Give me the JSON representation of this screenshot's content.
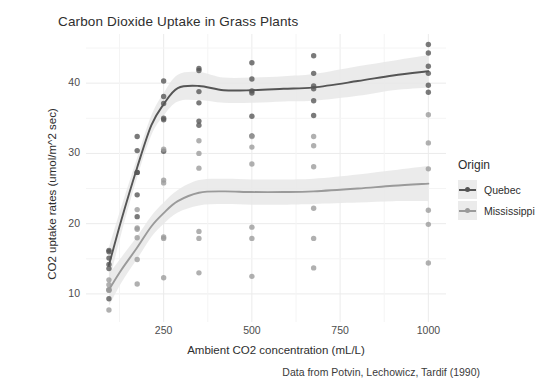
{
  "chart_data": {
    "type": "scatter",
    "title": "Carbon Dioxide Uptake in Grass Plants",
    "xlabel": "Ambient CO2 concentration (mL/L)",
    "ylabel": "CO2 uptake rates (umol/m^2 sec)",
    "caption": "Data from Potvin, Lechowicz, Tardif (1990)",
    "xlim": [
      30,
      1050
    ],
    "ylim": [
      6,
      47
    ],
    "xticks": [
      250,
      500,
      750,
      1000
    ],
    "yticks": [
      10,
      20,
      30,
      40
    ],
    "grid": true,
    "legend_position": "right",
    "legend_title": "Origin",
    "smoother": "loess with confidence ribbon",
    "colors": {
      "quebec": "#555555",
      "mississippi": "#9a9a9a",
      "ribbon": "#e8e8e8",
      "panel_background": "#ffffff",
      "gridline": "#ebebeb",
      "text": "#2e2e2e",
      "tick_text": "#4d4d4d"
    },
    "series": [
      {
        "name": "Quebec",
        "color": "#555555",
        "points": [
          {
            "x": 95,
            "y": 16.0
          },
          {
            "x": 175,
            "y": 30.4
          },
          {
            "x": 250,
            "y": 34.8
          },
          {
            "x": 350,
            "y": 37.2
          },
          {
            "x": 500,
            "y": 35.3
          },
          {
            "x": 675,
            "y": 39.2
          },
          {
            "x": 1000,
            "y": 39.7
          },
          {
            "x": 95,
            "y": 13.6
          },
          {
            "x": 175,
            "y": 27.3
          },
          {
            "x": 250,
            "y": 37.1
          },
          {
            "x": 350,
            "y": 41.8
          },
          {
            "x": 500,
            "y": 40.6
          },
          {
            "x": 675,
            "y": 41.4
          },
          {
            "x": 1000,
            "y": 44.3
          },
          {
            "x": 95,
            "y": 16.2
          },
          {
            "x": 175,
            "y": 32.4
          },
          {
            "x": 250,
            "y": 40.3
          },
          {
            "x": 350,
            "y": 42.1
          },
          {
            "x": 500,
            "y": 42.9
          },
          {
            "x": 675,
            "y": 43.9
          },
          {
            "x": 1000,
            "y": 45.5
          },
          {
            "x": 95,
            "y": 14.2
          },
          {
            "x": 175,
            "y": 24.1
          },
          {
            "x": 250,
            "y": 30.3
          },
          {
            "x": 350,
            "y": 34.6
          },
          {
            "x": 500,
            "y": 32.5
          },
          {
            "x": 675,
            "y": 35.4
          },
          {
            "x": 1000,
            "y": 38.7
          },
          {
            "x": 95,
            "y": 9.3
          },
          {
            "x": 175,
            "y": 27.3
          },
          {
            "x": 250,
            "y": 35.0
          },
          {
            "x": 350,
            "y": 38.8
          },
          {
            "x": 500,
            "y": 38.6
          },
          {
            "x": 675,
            "y": 37.5
          },
          {
            "x": 1000,
            "y": 42.4
          },
          {
            "x": 95,
            "y": 15.1
          },
          {
            "x": 175,
            "y": 21.0
          },
          {
            "x": 250,
            "y": 38.1
          },
          {
            "x": 350,
            "y": 34.0
          },
          {
            "x": 500,
            "y": 38.9
          },
          {
            "x": 675,
            "y": 39.6
          },
          {
            "x": 1000,
            "y": 41.4
          }
        ]
      },
      {
        "name": "Mississippi",
        "color": "#9a9a9a",
        "points": [
          {
            "x": 95,
            "y": 10.6
          },
          {
            "x": 175,
            "y": 19.2
          },
          {
            "x": 250,
            "y": 26.2
          },
          {
            "x": 350,
            "y": 30.0
          },
          {
            "x": 500,
            "y": 30.9
          },
          {
            "x": 675,
            "y": 32.4
          },
          {
            "x": 1000,
            "y": 35.5
          },
          {
            "x": 95,
            "y": 12.0
          },
          {
            "x": 175,
            "y": 22.0
          },
          {
            "x": 250,
            "y": 30.6
          },
          {
            "x": 350,
            "y": 31.8
          },
          {
            "x": 500,
            "y": 32.4
          },
          {
            "x": 675,
            "y": 31.1
          },
          {
            "x": 1000,
            "y": 31.5
          },
          {
            "x": 95,
            "y": 11.3
          },
          {
            "x": 175,
            "y": 19.4
          },
          {
            "x": 250,
            "y": 25.8
          },
          {
            "x": 350,
            "y": 27.9
          },
          {
            "x": 500,
            "y": 28.5
          },
          {
            "x": 675,
            "y": 28.1
          },
          {
            "x": 1000,
            "y": 27.8
          },
          {
            "x": 95,
            "y": 10.5
          },
          {
            "x": 175,
            "y": 14.9
          },
          {
            "x": 250,
            "y": 18.1
          },
          {
            "x": 350,
            "y": 18.9
          },
          {
            "x": 500,
            "y": 19.5
          },
          {
            "x": 675,
            "y": 22.2
          },
          {
            "x": 1000,
            "y": 21.9
          },
          {
            "x": 95,
            "y": 7.7
          },
          {
            "x": 175,
            "y": 11.4
          },
          {
            "x": 250,
            "y": 12.3
          },
          {
            "x": 350,
            "y": 13.0
          },
          {
            "x": 500,
            "y": 12.5
          },
          {
            "x": 675,
            "y": 13.7
          },
          {
            "x": 1000,
            "y": 14.4
          },
          {
            "x": 95,
            "y": 10.6
          },
          {
            "x": 175,
            "y": 18.0
          },
          {
            "x": 250,
            "y": 17.9
          },
          {
            "x": 350,
            "y": 17.9
          },
          {
            "x": 500,
            "y": 17.9
          },
          {
            "x": 675,
            "y": 17.9
          },
          {
            "x": 1000,
            "y": 19.9
          }
        ]
      }
    ],
    "smooth_curves": [
      {
        "name": "Quebec",
        "color": "#555555",
        "x": [
          95,
          130,
          175,
          215,
          250,
          290,
          350,
          420,
          500,
          590,
          675,
          800,
          900,
          1000
        ],
        "y": [
          14.1,
          20.5,
          28.0,
          34.0,
          37.0,
          39.3,
          39.6,
          39.0,
          39.0,
          39.2,
          39.4,
          40.3,
          41.1,
          41.7
        ],
        "ymin": [
          11.6,
          18.6,
          26.6,
          32.6,
          35.4,
          37.4,
          37.6,
          37.2,
          37.2,
          37.4,
          37.5,
          38.2,
          39.0,
          39.4
        ],
        "ymax": [
          16.6,
          22.4,
          29.4,
          35.4,
          38.6,
          41.2,
          41.6,
          40.8,
          40.8,
          41.0,
          41.3,
          42.4,
          43.2,
          44.0
        ]
      },
      {
        "name": "Mississippi",
        "color": "#9a9a9a",
        "x": [
          95,
          130,
          175,
          215,
          250,
          290,
          350,
          420,
          500,
          590,
          675,
          800,
          900,
          1000
        ],
        "y": [
          10.6,
          13.4,
          16.6,
          19.6,
          21.5,
          23.2,
          24.4,
          24.6,
          24.5,
          24.5,
          24.6,
          25.0,
          25.4,
          25.7
        ],
        "ymin": [
          8.3,
          11.6,
          15.0,
          18.1,
          20.0,
          21.6,
          22.6,
          22.8,
          22.7,
          22.7,
          22.8,
          23.0,
          23.2,
          23.2
        ],
        "ymax": [
          12.9,
          15.2,
          18.2,
          21.1,
          23.0,
          24.8,
          26.2,
          26.4,
          26.3,
          26.3,
          26.4,
          27.0,
          27.6,
          28.2
        ]
      }
    ],
    "legend_entries": [
      {
        "label": "Quebec",
        "color": "#555555"
      },
      {
        "label": "Mississippi",
        "color": "#9a9a9a"
      }
    ]
  }
}
